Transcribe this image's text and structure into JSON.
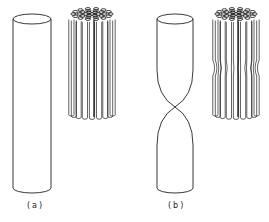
{
  "figure": {
    "panels": [
      {
        "id": "a",
        "label": "(a)",
        "description": "Single uniform cylinder and bundle of straight filaments"
      },
      {
        "id": "b",
        "label": "(b)",
        "description": "Cylinder pinched at the middle and bundle of filaments with a central constriction"
      }
    ],
    "colors": {
      "stroke": "#222222",
      "background": "#ffffff"
    }
  }
}
